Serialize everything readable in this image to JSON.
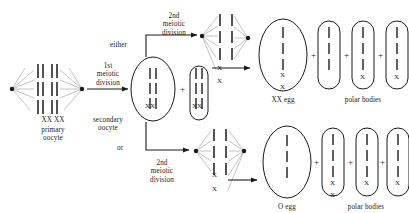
{
  "diagram": {
    "type": "biology-process-diagram",
    "ink_color": "#1a1a1a",
    "spindle_color": "#8a8a8a",
    "background": "#ffffff"
  },
  "labels": {
    "first_meiotic_division": "1st\nmeiotic\ndivision",
    "second_meiotic_division_top": "2nd\nmeiotic\ndivision",
    "second_meiotic_division_bottom": "2nd\nmeiotic\ndivision",
    "primary_oocyte": "XX XX\nprimary\noocyte",
    "primary_oocyte_chromosomes": "XX XX",
    "primary_oocyte_name": "primary\noocyte",
    "secondary_oocyte": "secondary\noocyte",
    "either": "either",
    "or": "or",
    "xx_egg": "XX egg",
    "o_egg": "O egg",
    "polar_bodies_top": "polar bodies",
    "polar_bodies_bottom": "polar bodies",
    "plus": "+",
    "chromosome_x": "X",
    "secondary_oocyte_big_xx": "XX",
    "secondary_oocyte_small_xx": "XX"
  },
  "cells": {
    "primary_oocyte": {
      "name": "primary oocyte",
      "chromosome_rows": 3,
      "bars_per_row": 4,
      "poles": 2,
      "label_below": "XX XX"
    },
    "secondary_oocyte_large": {
      "name": "secondary oocyte",
      "shape": "oval",
      "chromosome_rows": 3,
      "label_inside": "XX"
    },
    "first_polar_body": {
      "name": "first polar body",
      "shape": "capsule",
      "chromosome_rows": 3,
      "label_inside": "XX"
    },
    "xx_egg": {
      "name": "XX egg",
      "shape": "oval",
      "dashes": 3,
      "x_labels": [
        "X",
        "X"
      ]
    },
    "o_egg": {
      "name": "O egg",
      "shape": "oval",
      "dashes": 3,
      "x_labels": []
    },
    "polar_bodies_top": [
      {
        "dashes": 3,
        "x_labels": []
      },
      {
        "dashes": 3,
        "x_labels": [
          "X"
        ]
      },
      {
        "dashes": 3,
        "x_labels": [
          "X"
        ]
      }
    ],
    "polar_bodies_bottom": [
      {
        "dashes": 3,
        "x_labels": [
          "X",
          "X"
        ]
      },
      {
        "dashes": 3,
        "x_labels": [
          "X"
        ]
      },
      {
        "dashes": 3,
        "x_labels": [
          "X"
        ]
      }
    ]
  },
  "spindles": {
    "top_left": {
      "x_labels": [
        "X",
        "X"
      ]
    },
    "top_right": {
      "x_labels": []
    },
    "bottom_left": {
      "x_labels": []
    },
    "bottom_right": {
      "x_labels": [
        "X",
        "X"
      ]
    }
  }
}
